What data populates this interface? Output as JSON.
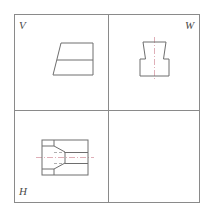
{
  "drawing": {
    "title": "Three-view orthographic projection",
    "stroke_color": "#6e6e6e",
    "center_line_color": "#d79aa6",
    "hidden_line_color": "#9a9a9a",
    "background_color": "#ffffff",
    "frame": {
      "x": 14,
      "y": 14,
      "width": 186,
      "height": 189
    },
    "dividers": {
      "vertical_x": 108,
      "horizontal_y": 110
    },
    "labels": {
      "v": "V",
      "w": "W",
      "h": "H"
    },
    "views": {
      "v": {
        "name": "front-view",
        "label": "V",
        "outline_points": "53,75 61,43 93,43 93,75",
        "detail_lines": [
          {
            "name": "horizontal-division-line",
            "x1": 57,
            "y1": 60,
            "x2": 93,
            "y2": 60
          }
        ]
      },
      "w": {
        "name": "side-view",
        "label": "W",
        "outline_points": "140,76 140,59 145,59 143,42 166,42 163,59 169,59 169,76",
        "center_lines": [
          {
            "name": "vertical-center-line",
            "x1": 154,
            "y1": 38,
            "x2": 154,
            "y2": 80
          }
        ]
      },
      "h": {
        "name": "top-view",
        "label": "H",
        "outline_points": "42,140 88,140 88,175 42,175",
        "detail_lines": [
          {
            "name": "notch-upper-slant",
            "x1": 42,
            "y1": 146,
            "x2": 54,
            "y2": 146
          },
          {
            "name": "notch-lower-slant",
            "x1": 42,
            "y1": 169,
            "x2": 54,
            "y2": 169
          },
          {
            "name": "notch-v-upper",
            "x1": 54,
            "y1": 146,
            "x2": 65,
            "y2": 152
          },
          {
            "name": "notch-v-lower",
            "x1": 54,
            "y1": 169,
            "x2": 65,
            "y2": 163
          },
          {
            "name": "notch-left-upper",
            "x1": 54,
            "y1": 146,
            "x2": 54,
            "y2": 152
          },
          {
            "name": "notch-left-lower",
            "x1": 54,
            "y1": 163,
            "x2": 54,
            "y2": 169
          },
          {
            "name": "inner-vertical-left",
            "x1": 54,
            "y1": 140,
            "x2": 54,
            "y2": 146
          },
          {
            "name": "inner-vertical-left-2",
            "x1": 54,
            "y1": 169,
            "x2": 54,
            "y2": 175
          },
          {
            "name": "inner-vertical-right",
            "x1": 65,
            "y1": 152,
            "x2": 65,
            "y2": 163
          },
          {
            "name": "step-top",
            "x1": 65,
            "y1": 152,
            "x2": 88,
            "y2": 152
          },
          {
            "name": "step-bottom",
            "x1": 65,
            "y1": 163,
            "x2": 88,
            "y2": 163
          }
        ],
        "hidden_lines": [
          {
            "name": "hidden-line-upper",
            "x1": 54,
            "y1": 152,
            "x2": 88,
            "y2": 152
          },
          {
            "name": "hidden-line-lower",
            "x1": 54,
            "y1": 163,
            "x2": 88,
            "y2": 163
          }
        ],
        "center_lines": [
          {
            "name": "horizontal-center-line",
            "x1": 36,
            "y1": 157,
            "x2": 94,
            "y2": 157
          }
        ]
      }
    }
  }
}
